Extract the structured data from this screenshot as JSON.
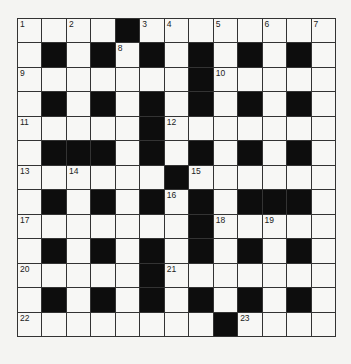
{
  "puzzle": {
    "rows": 13,
    "cols": 13,
    "colors": {
      "black": "#0d0d0d",
      "white": "#f7f7f5",
      "line": "#333333"
    },
    "layout": [
      "..._#.._._._.",
      ".#.#.#.#.#.#.",
      ".......#.....",
      ".#.#.#.#.#.#.",
      ".....#.......",
      ".###.#.#.#.#.",
      "......#......",
      ".#.#.#.#.###.",
      ".......#.....",
      ".#.#.#.#.#.#.",
      ".....#.......",
      ".#.#.#.#.#.#.",
      "........#...."
    ],
    "numbers": [
      {
        "r": 0,
        "c": 0,
        "n": "1"
      },
      {
        "r": 0,
        "c": 2,
        "n": "2"
      },
      {
        "r": 0,
        "c": 5,
        "n": "3"
      },
      {
        "r": 0,
        "c": 6,
        "n": "4"
      },
      {
        "r": 0,
        "c": 8,
        "n": "5"
      },
      {
        "r": 0,
        "c": 10,
        "n": "6"
      },
      {
        "r": 0,
        "c": 12,
        "n": "7"
      },
      {
        "r": 1,
        "c": 4,
        "n": "8"
      },
      {
        "r": 2,
        "c": 0,
        "n": "9"
      },
      {
        "r": 2,
        "c": 8,
        "n": "10"
      },
      {
        "r": 4,
        "c": 0,
        "n": "11"
      },
      {
        "r": 4,
        "c": 6,
        "n": "12"
      },
      {
        "r": 6,
        "c": 0,
        "n": "13"
      },
      {
        "r": 6,
        "c": 2,
        "n": "14"
      },
      {
        "r": 6,
        "c": 7,
        "n": "15"
      },
      {
        "r": 7,
        "c": 6,
        "n": "16"
      },
      {
        "r": 8,
        "c": 0,
        "n": "17"
      },
      {
        "r": 8,
        "c": 8,
        "n": "18"
      },
      {
        "r": 8,
        "c": 10,
        "n": "19"
      },
      {
        "r": 10,
        "c": 0,
        "n": "20"
      },
      {
        "r": 10,
        "c": 6,
        "n": "21"
      },
      {
        "r": 12,
        "c": 0,
        "n": "22"
      },
      {
        "r": 12,
        "c": 9,
        "n": "23"
      }
    ]
  }
}
